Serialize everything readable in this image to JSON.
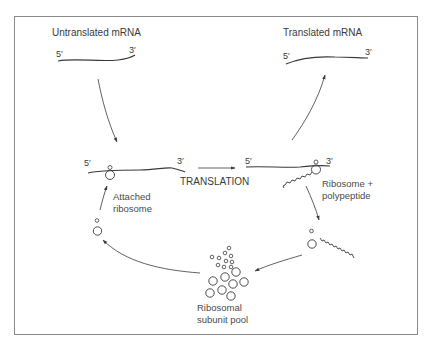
{
  "figure": {
    "type": "diagram",
    "colors": {
      "line": "#3a3a3a",
      "frame": "#8a8a8a",
      "background": "#ffffff"
    }
  },
  "labels": {
    "untranslated_title": "Untranslated mRNA",
    "translated_title": "Translated mRNA",
    "attached_ribosome_line1": "Attached",
    "attached_ribosome_line2": "ribosome",
    "translation": "TRANSLATION",
    "ribosome_polypeptide_line1": "Ribosome +",
    "ribosome_polypeptide_line2": "polypeptide",
    "pool_line1": "Ribosomal",
    "pool_line2": "subunit pool"
  },
  "ends": {
    "five_prime": "5′",
    "three_prime": "3′"
  },
  "nodes": [
    {
      "id": "untranslated-mrna",
      "label": "Untranslated mRNA"
    },
    {
      "id": "attached-ribosome",
      "label": "Attached ribosome"
    },
    {
      "id": "ribosome-polypeptide",
      "label": "Ribosome + polypeptide"
    },
    {
      "id": "translated-mrna",
      "label": "Translated mRNA"
    },
    {
      "id": "free-ribosome-with-polypeptide",
      "label": ""
    },
    {
      "id": "ribosomal-subunit-pool",
      "label": "Ribosomal subunit pool"
    },
    {
      "id": "free-ribosome",
      "label": ""
    }
  ],
  "edges": [
    {
      "from": "untranslated-mrna",
      "to": "attached-ribosome",
      "label": ""
    },
    {
      "from": "attached-ribosome",
      "to": "ribosome-polypeptide",
      "label": "TRANSLATION"
    },
    {
      "from": "ribosome-polypeptide",
      "to": "translated-mrna",
      "label": ""
    },
    {
      "from": "ribosome-polypeptide",
      "to": "free-ribosome-with-polypeptide",
      "label": ""
    },
    {
      "from": "free-ribosome-with-polypeptide",
      "to": "ribosomal-subunit-pool",
      "label": ""
    },
    {
      "from": "ribosomal-subunit-pool",
      "to": "free-ribosome",
      "label": ""
    },
    {
      "from": "free-ribosome",
      "to": "attached-ribosome",
      "label": ""
    }
  ]
}
